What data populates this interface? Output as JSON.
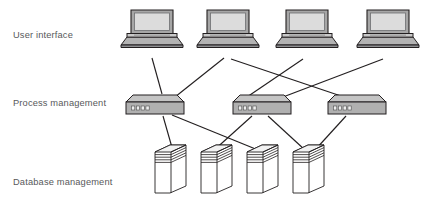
{
  "diagram": {
    "type": "three-tier-architecture-diagram",
    "title": "",
    "background_color": "#ffffff",
    "line_color": "#231f20",
    "label_color": "#58595b",
    "node_fill": "#b3b3b3",
    "node_fill_light": "#d9d9d9",
    "node_stroke": "#231f20",
    "tiers": [
      {
        "id": "user-interface",
        "label": "User interface",
        "node_type": "laptop",
        "count": 4,
        "nodes": [
          {
            "id": "laptop-1",
            "x": 152,
            "y": 33
          },
          {
            "id": "laptop-2",
            "x": 228,
            "y": 33
          },
          {
            "id": "laptop-3",
            "x": 307,
            "y": 33
          },
          {
            "id": "laptop-4",
            "x": 388,
            "y": 33
          }
        ]
      },
      {
        "id": "process-management",
        "label": "Process management",
        "node_type": "router",
        "count": 3,
        "nodes": [
          {
            "id": "router-1",
            "x": 155,
            "y": 104
          },
          {
            "id": "router-2",
            "x": 262,
            "y": 104
          },
          {
            "id": "router-3",
            "x": 357,
            "y": 104
          }
        ]
      },
      {
        "id": "database-management",
        "label": "Database management",
        "node_type": "server-tower",
        "count": 4,
        "nodes": [
          {
            "id": "server-1",
            "x": 170,
            "y": 168
          },
          {
            "id": "server-2",
            "x": 216,
            "y": 168
          },
          {
            "id": "server-3",
            "x": 262,
            "y": 168
          },
          {
            "id": "server-4",
            "x": 308,
            "y": 168
          }
        ]
      }
    ],
    "links": [
      {
        "from": "laptop-1",
        "to": "router-1",
        "x1": 152,
        "y1": 58,
        "x2": 162,
        "y2": 94
      },
      {
        "from": "laptop-2",
        "to": "router-1",
        "x1": 224,
        "y1": 58,
        "x2": 178,
        "y2": 97
      },
      {
        "from": "laptop-2",
        "to": "router-3",
        "x1": 231,
        "y1": 59,
        "x2": 340,
        "y2": 96
      },
      {
        "from": "laptop-3",
        "to": "router-2",
        "x1": 303,
        "y1": 59,
        "x2": 248,
        "y2": 97
      },
      {
        "from": "laptop-4",
        "to": "router-2",
        "x1": 383,
        "y1": 59,
        "x2": 283,
        "y2": 97
      },
      {
        "from": "router-1",
        "to": "server-1",
        "x1": 163,
        "y1": 116,
        "x2": 173,
        "y2": 150
      },
      {
        "from": "router-1",
        "to": "server-3",
        "x1": 172,
        "y1": 116,
        "x2": 258,
        "y2": 150
      },
      {
        "from": "router-2",
        "to": "server-2",
        "x1": 252,
        "y1": 116,
        "x2": 213,
        "y2": 152
      },
      {
        "from": "router-2",
        "to": "server-4",
        "x1": 268,
        "y1": 116,
        "x2": 305,
        "y2": 150
      },
      {
        "from": "router-3",
        "to": "server-4",
        "x1": 345,
        "y1": 116,
        "x2": 314,
        "y2": 150
      }
    ]
  }
}
